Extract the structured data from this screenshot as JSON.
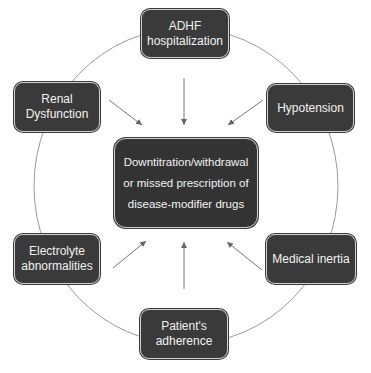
{
  "diagram": {
    "center": {
      "label": "Downtitration/withdrawal\nor missed prescription of\ndisease-modifier drugs"
    },
    "nodes": [
      {
        "id": "adhf",
        "label": "ADHF\nhospitalization"
      },
      {
        "id": "hypotension",
        "label": "Hypotension"
      },
      {
        "id": "medical-inertia",
        "label": "Medical inertia"
      },
      {
        "id": "adherence",
        "label": "Patient's\nadherence"
      },
      {
        "id": "electrolyte",
        "label": "Electrolyte\nabnormalities"
      },
      {
        "id": "renal",
        "label": "Renal\nDysfunction"
      }
    ],
    "colors": {
      "box": "#3a3a3a",
      "text": "#f2f2f2",
      "lines": "#777777"
    }
  }
}
